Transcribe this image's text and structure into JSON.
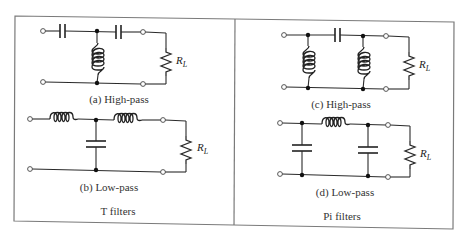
{
  "figure": {
    "panels": [
      {
        "title": "T filters",
        "circuits": [
          {
            "caption": "(a) High-pass",
            "type": "T",
            "series": "capacitor",
            "shunt": "inductor",
            "load": "R",
            "load_sub": "L"
          },
          {
            "caption": "(b) Low-pass",
            "type": "T",
            "series": "inductor",
            "shunt": "capacitor",
            "load": "R",
            "load_sub": "L"
          }
        ]
      },
      {
        "title": "Pi filters",
        "circuits": [
          {
            "caption": "(c) High-pass",
            "type": "Pi",
            "series": "capacitor",
            "shunt": "inductor",
            "load": "R",
            "load_sub": "L"
          },
          {
            "caption": "(d) Low-pass",
            "type": "Pi",
            "series": "inductor",
            "shunt": "capacitor",
            "load": "R",
            "load_sub": "L"
          }
        ]
      }
    ],
    "colors": {
      "ink": "#222222",
      "frame": "#7a7a7a",
      "background": "#ffffff"
    }
  }
}
